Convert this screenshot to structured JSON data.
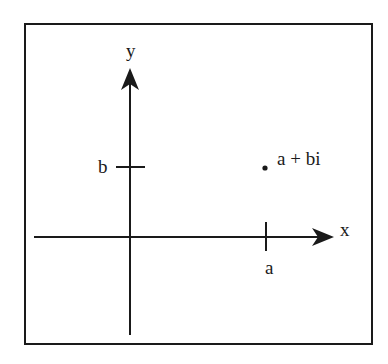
{
  "diagram": {
    "axes": {
      "x_label": "x",
      "y_label": "y"
    },
    "ticks": {
      "x_tick_label": "a",
      "y_tick_label": "b"
    },
    "point": {
      "label": "a + bi"
    },
    "colors": {
      "stroke": "#1a1a1a",
      "background": "#ffffff"
    }
  }
}
